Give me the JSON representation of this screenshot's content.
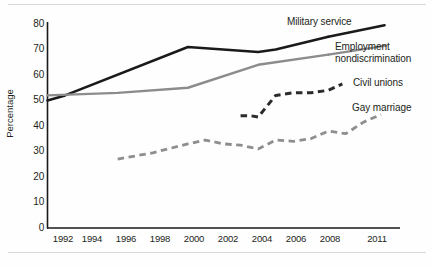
{
  "chart_data": {
    "type": "line",
    "title": "",
    "xlabel": "",
    "ylabel": "Percentage",
    "xlim": [
      1992,
      2011
    ],
    "ylim": [
      0,
      80
    ],
    "yticks": [
      0,
      10,
      20,
      30,
      40,
      50,
      60,
      70,
      80
    ],
    "xticks": [
      1992,
      1994,
      1996,
      1998,
      2000,
      2002,
      2004,
      2006,
      2008,
      2011
    ],
    "xtick_labels": [
      "1992",
      "1994",
      "1996",
      "1998",
      "2000",
      "2002",
      "2004",
      "2006",
      "2008",
      "2011"
    ],
    "ytick_labels": [
      "0",
      "10",
      "20",
      "30",
      "40",
      "50",
      "60",
      "70",
      "80"
    ],
    "grid": false,
    "legend_position": "inline-right-of-lines",
    "series": [
      {
        "name": "Military service",
        "color": "#1a1a1a",
        "style": "solid",
        "width": 2.6,
        "x": [
          1992,
          1993,
          2000,
          2004,
          2005,
          2008
        ],
        "values": [
          50,
          52,
          71,
          69,
          70,
          75
        ]
      },
      {
        "name": "Employment nondiscrimination",
        "color": "#8c8c8c",
        "style": "solid",
        "width": 2.4,
        "x": [
          1992,
          1996,
          2000,
          2004,
          2008
        ],
        "values": [
          52,
          53,
          55,
          64,
          68
        ]
      },
      {
        "name": "Civil unions",
        "color": "#2b2b2b",
        "style": "dashed",
        "width": 3.0,
        "x": [
          2003,
          2003.6,
          2004,
          2005,
          2006,
          2007,
          2008,
          2008.8
        ],
        "values": [
          44,
          44,
          43.5,
          52,
          53,
          53,
          54,
          56.5
        ]
      },
      {
        "name": "Gay marriage",
        "color": "#8e8e8e",
        "style": "dashed",
        "width": 2.8,
        "x": [
          1996,
          1998,
          2000,
          2001,
          2002,
          2003,
          2004,
          2005,
          2006,
          2007,
          2008,
          2009,
          2010,
          2011
        ],
        "values": [
          27,
          29.5,
          33,
          34.5,
          33,
          32.5,
          31,
          34.5,
          34,
          35,
          38,
          37,
          41.5,
          44.5
        ]
      }
    ],
    "axis_color": "#1a1a1a",
    "background": "#ffffff"
  }
}
